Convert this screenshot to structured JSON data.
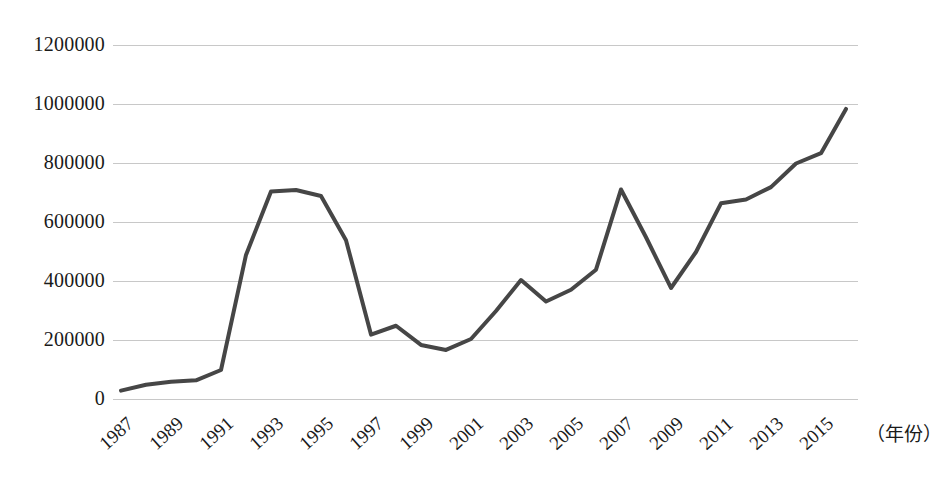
{
  "chart_data": {
    "type": "line",
    "title": "",
    "xlabel": "（年份）",
    "ylabel": "",
    "xlim": [
      1987,
      2016
    ],
    "ylim": [
      0,
      1200000
    ],
    "ytick_labels": [
      "1200000",
      "1000000",
      "800000",
      "600000",
      "400000",
      "200000",
      "0"
    ],
    "ytick_values": [
      1200000,
      1000000,
      800000,
      600000,
      400000,
      200000,
      0
    ],
    "xtick_labels": [
      "1987",
      "1989",
      "1991",
      "1993",
      "1995",
      "1997",
      "1999",
      "2001",
      "2003",
      "2005",
      "2007",
      "2009",
      "2011",
      "2013",
      "2015"
    ],
    "xtick_values": [
      1987,
      1989,
      1991,
      1993,
      1995,
      1997,
      1999,
      2001,
      2003,
      2005,
      2007,
      2009,
      2011,
      2013,
      2015
    ],
    "grid": "horizontal",
    "legend": "none",
    "line_color": "#464646",
    "grid_color": "#c8c8c8",
    "x": [
      1987,
      1988,
      1989,
      1990,
      1991,
      1992,
      1993,
      1994,
      1995,
      1996,
      1997,
      1998,
      1999,
      2000,
      2001,
      2002,
      2003,
      2004,
      2005,
      2006,
      2007,
      2008,
      2009,
      2010,
      2011,
      2012,
      2013,
      2014,
      2015,
      2016
    ],
    "values": [
      30000,
      50000,
      60000,
      65000,
      100000,
      490000,
      705000,
      710000,
      690000,
      540000,
      220000,
      250000,
      185000,
      168000,
      205000,
      300000,
      405000,
      332000,
      372000,
      440000,
      712000,
      550000,
      378000,
      500000,
      665000,
      678000,
      720000,
      800000,
      835000,
      985000
    ]
  }
}
